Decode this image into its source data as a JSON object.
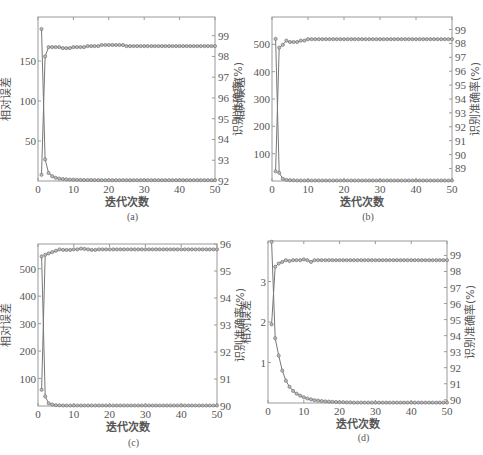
{
  "chart_data": [
    {
      "id": "a",
      "type": "line",
      "caption": "(a)",
      "xlabel": "迭代次数",
      "ylabel_left": "相对误差",
      "ylabel_right": "识别准确率(%)",
      "xlim": [
        0,
        50
      ],
      "xticks": [
        0,
        10,
        20,
        30,
        40,
        50
      ],
      "ylim_left": [
        0,
        205
      ],
      "yticks_left": [
        50,
        100,
        150
      ],
      "ylim_right": [
        92,
        99.9
      ],
      "yticks_right": [
        92,
        93,
        94,
        95,
        96,
        97,
        98,
        99
      ],
      "series": [
        {
          "name": "相对误差",
          "axis": "left",
          "values": [
            190,
            27,
            10,
            6,
            4,
            3,
            2.5,
            2,
            1.8,
            1.6,
            1.5,
            1.4,
            1.3,
            1.2,
            1.2,
            1.1,
            1.1,
            1,
            1,
            1,
            1,
            1,
            1,
            1,
            1,
            1,
            1,
            1,
            1,
            1,
            1,
            1,
            1,
            1,
            1,
            1,
            1,
            1,
            1,
            1,
            1,
            1,
            1,
            1,
            1,
            1,
            1,
            1,
            1,
            1
          ]
        },
        {
          "name": "识别准确率(%)",
          "axis": "right",
          "values": [
            92.3,
            98.0,
            98.45,
            98.45,
            98.45,
            98.45,
            98.4,
            98.4,
            98.4,
            98.45,
            98.45,
            98.45,
            98.45,
            98.5,
            98.5,
            98.5,
            98.5,
            98.55,
            98.55,
            98.55,
            98.55,
            98.55,
            98.55,
            98.55,
            98.5,
            98.5,
            98.5,
            98.5,
            98.5,
            98.5,
            98.5,
            98.5,
            98.5,
            98.5,
            98.5,
            98.5,
            98.5,
            98.5,
            98.5,
            98.5,
            98.5,
            98.5,
            98.5,
            98.5,
            98.5,
            98.5,
            98.5,
            98.5,
            98.5,
            98.5
          ]
        }
      ],
      "grid": false,
      "markers": "circle"
    },
    {
      "id": "b",
      "type": "line",
      "caption": "(b)",
      "xlabel": "迭代次数",
      "ylabel_left": "相对误差",
      "ylabel_right": "识别准确率(%)",
      "xlim": [
        0,
        50
      ],
      "xticks": [
        0,
        10,
        20,
        30,
        40,
        50
      ],
      "ylim_left": [
        0,
        600
      ],
      "yticks_left": [
        100,
        200,
        300,
        400,
        500
      ],
      "ylim_right": [
        88.1,
        99.9
      ],
      "yticks_right": [
        89,
        90,
        91,
        92,
        93,
        94,
        95,
        96,
        97,
        98,
        99
      ],
      "series": [
        {
          "name": "相对误差",
          "axis": "left",
          "values": [
            520,
            30,
            8,
            4,
            3,
            2.5,
            2,
            2,
            2,
            2,
            2,
            2,
            2,
            2,
            2,
            2,
            2,
            2,
            2,
            2,
            2,
            2,
            2,
            2,
            2,
            2,
            2,
            2,
            2,
            2,
            2,
            2,
            2,
            2,
            2,
            2,
            2,
            2,
            2,
            2,
            2,
            2,
            2,
            2,
            2,
            2,
            2,
            2,
            2,
            2
          ]
        },
        {
          "name": "识别准确率(%)",
          "axis": "right",
          "values": [
            88.8,
            97.7,
            97.9,
            98.2,
            98.1,
            98.1,
            98.1,
            98.2,
            98.2,
            98.3,
            98.3,
            98.3,
            98.3,
            98.3,
            98.3,
            98.3,
            98.3,
            98.3,
            98.3,
            98.3,
            98.3,
            98.3,
            98.3,
            98.3,
            98.3,
            98.3,
            98.3,
            98.3,
            98.3,
            98.3,
            98.3,
            98.3,
            98.3,
            98.3,
            98.3,
            98.3,
            98.3,
            98.3,
            98.3,
            98.3,
            98.3,
            98.3,
            98.3,
            98.3,
            98.3,
            98.3,
            98.3,
            98.3,
            98.3,
            98.3
          ]
        }
      ],
      "grid": false,
      "markers": "circle"
    },
    {
      "id": "c",
      "type": "line",
      "caption": "(c)",
      "xlabel": "迭代次数",
      "ylabel_left": "相对误差",
      "ylabel_right": "识别准确率(%)",
      "xlim": [
        0,
        50
      ],
      "xticks": [
        0,
        10,
        20,
        30,
        40,
        50
      ],
      "ylim_left": [
        0,
        590
      ],
      "yticks_left": [
        100,
        200,
        300,
        400,
        500
      ],
      "ylim_right": [
        90,
        96
      ],
      "yticks_right": [
        90,
        91,
        92,
        93,
        94,
        95,
        96
      ],
      "series": [
        {
          "name": "相对误差",
          "axis": "left",
          "values": [
            545,
            35,
            10,
            5,
            3,
            2.5,
            2,
            2,
            2,
            2,
            2,
            2,
            2,
            2,
            2,
            2,
            2,
            2,
            2,
            2,
            2,
            2,
            2,
            2,
            2,
            2,
            2,
            2,
            2,
            2,
            2,
            2,
            2,
            2,
            2,
            2,
            2,
            2,
            2,
            2,
            2,
            2,
            2,
            2,
            2,
            2,
            2,
            2,
            2,
            2
          ]
        },
        {
          "name": "识别准确率(%)",
          "axis": "right",
          "values": [
            90.6,
            95.6,
            95.65,
            95.7,
            95.75,
            95.8,
            95.78,
            95.78,
            95.78,
            95.8,
            95.8,
            95.83,
            95.82,
            95.8,
            95.78,
            95.78,
            95.8,
            95.8,
            95.8,
            95.8,
            95.8,
            95.8,
            95.8,
            95.8,
            95.8,
            95.8,
            95.8,
            95.8,
            95.8,
            95.8,
            95.8,
            95.8,
            95.8,
            95.8,
            95.8,
            95.8,
            95.8,
            95.8,
            95.8,
            95.8,
            95.8,
            95.8,
            95.8,
            95.8,
            95.8,
            95.8,
            95.8,
            95.8,
            95.8,
            95.8
          ]
        }
      ],
      "grid": false,
      "markers": "circle"
    },
    {
      "id": "d",
      "type": "line",
      "caption": "(d)",
      "xlabel": "迭代次数",
      "ylabel_left": "相对误差",
      "ylabel_right": "识别准确率(%)",
      "xlim": [
        0,
        50
      ],
      "xticks": [
        0,
        10,
        20,
        30,
        40,
        50
      ],
      "ylim_left": [
        0,
        4
      ],
      "yticks_left": [
        1,
        2,
        3
      ],
      "ylim_right": [
        89.8,
        99.9
      ],
      "yticks_right": [
        90,
        91,
        92,
        93,
        94,
        95,
        96,
        97,
        98,
        99
      ],
      "series": [
        {
          "name": "相对误差",
          "axis": "left",
          "values": [
            3.98,
            1.6,
            1.17,
            0.8,
            0.55,
            0.4,
            0.3,
            0.23,
            0.18,
            0.14,
            0.11,
            0.09,
            0.07,
            0.06,
            0.05,
            0.04,
            0.035,
            0.03,
            0.025,
            0.02,
            0.02,
            0.015,
            0.015,
            0.01,
            0.01,
            0.01,
            0.01,
            0.01,
            0.01,
            0.01,
            0.01,
            0.01,
            0.01,
            0.01,
            0.01,
            0.01,
            0.01,
            0.01,
            0.01,
            0.01,
            0.01,
            0.01,
            0.01,
            0.01,
            0.01,
            0.01,
            0.01,
            0.01,
            0.01,
            0.01
          ]
        },
        {
          "name": "识别准确率(%)",
          "axis": "right",
          "values": [
            94.7,
            98.3,
            98.5,
            98.6,
            98.7,
            98.65,
            98.7,
            98.7,
            98.7,
            98.75,
            98.7,
            98.6,
            98.7,
            98.7,
            98.7,
            98.7,
            98.7,
            98.7,
            98.7,
            98.7,
            98.7,
            98.7,
            98.7,
            98.7,
            98.7,
            98.7,
            98.7,
            98.7,
            98.7,
            98.7,
            98.7,
            98.7,
            98.7,
            98.7,
            98.7,
            98.7,
            98.7,
            98.7,
            98.7,
            98.7,
            98.7,
            98.7,
            98.7,
            98.7,
            98.7,
            98.7,
            98.7,
            98.7,
            98.7,
            98.7
          ]
        }
      ],
      "grid": false,
      "markers": "circle"
    }
  ],
  "layout": {
    "panels": [
      {
        "id": "a",
        "box": [
          38,
          17,
          215,
          181
        ],
        "caption_y": 220
      },
      {
        "id": "b",
        "box": [
          272,
          17,
          452,
          181
        ],
        "caption_y": 220
      },
      {
        "id": "c",
        "box": [
          38,
          244,
          217,
          406
        ],
        "caption_y": 446
      },
      {
        "id": "d",
        "box": [
          268,
          241,
          447,
          403
        ],
        "caption_y": 441
      }
    ],
    "line_color": "#777777",
    "marker_color": "#666666",
    "axis_color": "#9a9a9a"
  }
}
